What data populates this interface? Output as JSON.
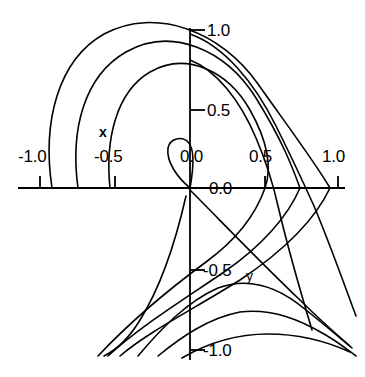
{
  "chart_data": {
    "type": "line",
    "title": "",
    "xlabel": "x",
    "ylabel": "y",
    "xlim": [
      -1.15,
      1.15
    ],
    "ylim": [
      -1.15,
      1.15
    ],
    "grid": false,
    "legend": null,
    "axes_style": "crossed-axes-at-origin",
    "x_ticks": [
      -1.0,
      -0.5,
      0.0,
      0.5,
      1.0
    ],
    "x_tick_labels": [
      "-1.0",
      "-0.5",
      "0.0",
      "0.5",
      "1.0"
    ],
    "y_ticks": [
      -1.0,
      -0.5,
      0.0,
      0.5,
      1.0
    ],
    "y_tick_labels": [
      "-1.0",
      "-0.5",
      "0.0",
      "0.5",
      "1.0"
    ],
    "series": [
      {
        "name": "contour-1",
        "comment": "innermost large arc, loops around upper-left and descends",
        "path": "M 110 188 C 105 140 116 92 150 72 C 186 51 228 71 250 110 C 268 142 272 168 265 188 C 256 214 236 240 206 262 C 168 290 130 322 98 356"
      },
      {
        "name": "contour-2",
        "comment": "second nested arc",
        "path": "M 78 188 C 70 130 84 76 126 52 C 172 26 226 50 256 98 C 282 140 292 166 300 188 C 288 216 262 246 224 272 C 180 302 138 328 108 356"
      },
      {
        "name": "contour-3",
        "comment": "third nested arc, outermost of the upper-left family",
        "path": "M 52 188 C 42 122 58 60 104 34 C 156 6 222 32 258 84 C 292 132 316 164 330 188 C 314 222 282 252 240 280 C 192 310 148 332 120 356"
      },
      {
        "name": "contour-4",
        "comment": "lower-left steep descending curve near the origin",
        "path": "M 186 196 C 176 240 160 288 140 320 C 128 340 116 350 104 356"
      },
      {
        "name": "cusp-loop",
        "comment": "small cusped loop just above and left of the origin",
        "path": "M 190 188 C 178 178 166 162 168 148 C 170 138 182 136 188 142 C 194 148 194 166 190 188 Z"
      },
      {
        "name": "saddle-ray-1",
        "comment": "diagonal ray leaving the origin toward lower right",
        "path": "M 190 190 C 220 220 260 262 300 300 C 320 320 336 334 350 346"
      },
      {
        "name": "saddle-arc-1",
        "comment": "first downward-arching curve, lower right quadrant",
        "path": "M 138 356 C 160 330 186 302 218 288 C 250 276 280 288 306 310 C 326 326 340 338 352 348"
      },
      {
        "name": "saddle-arc-2",
        "comment": "second downward-arching curve",
        "path": "M 158 356 C 180 338 208 318 240 312 C 272 308 300 320 324 334 C 338 342 348 350 356 356"
      },
      {
        "name": "saddle-arc-3",
        "comment": "third downward-arching curve, lowest",
        "path": "M 182 358 C 206 344 236 334 268 334 C 300 334 328 342 350 352"
      },
      {
        "name": "right-sweep-1",
        "comment": "upper-right arc descending through x=0.5",
        "path": "M 190 60 C 216 70 240 100 256 138 C 268 166 274 188 278 206 C 286 240 300 290 312 330"
      },
      {
        "name": "right-sweep-2",
        "comment": "upper-right arc descending through x~0.75",
        "path": "M 190 34 C 224 46 254 82 276 126 C 292 158 304 184 314 206 C 330 244 344 284 356 316"
      }
    ]
  },
  "labels": {
    "y_top": "1.0",
    "y_half": "0.5",
    "origin": "0.0",
    "y_neg_half": "-0.5",
    "y_neg_one": "-1.0",
    "x_neg_one": "-1.0",
    "x_neg_half": "-0.5",
    "x_zero": "0.0",
    "x_half": "0.5",
    "x_one": "1.0",
    "x_axis_name": "x",
    "y_axis_name": "y"
  },
  "style": {
    "line_color": "#000000",
    "axis_color": "#000000",
    "background": "#ffffff",
    "line_width": 1.6
  }
}
